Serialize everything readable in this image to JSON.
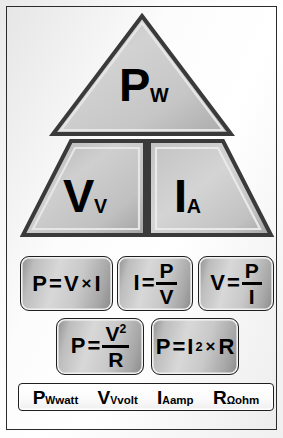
{
  "poster": {
    "title": "Ohm's Law / Power Pyramid Chart",
    "background_color": "#f2f2f2",
    "border_color": "#2b2b2b",
    "fill_color": "#c4c4c4"
  },
  "pyramid": {
    "top": {
      "symbol": "P",
      "subscript": "W",
      "shape": "triangle"
    },
    "left": {
      "symbol": "V",
      "subscript": "V",
      "shape": "trapezoid-left"
    },
    "right": {
      "symbol": "I",
      "subscript": "A",
      "shape": "trapezoid-right"
    }
  },
  "formulas": {
    "row1": [
      {
        "id": "power",
        "lhs": "P",
        "op": "=",
        "a": "V",
        "times": "×",
        "b": "I",
        "layout": "product"
      },
      {
        "id": "current",
        "lhs": "I",
        "op": "=",
        "num": "P",
        "den": "V",
        "layout": "fraction"
      },
      {
        "id": "voltage",
        "lhs": "V",
        "op": "=",
        "num": "P",
        "den": "I",
        "layout": "fraction"
      }
    ],
    "row2": [
      {
        "id": "power-v-squared",
        "lhs": "P",
        "op": "=",
        "num": "V",
        "num_sup": "2",
        "den": "R",
        "layout": "fraction-sup"
      },
      {
        "id": "power-i-squared",
        "lhs": "P",
        "op": "=",
        "a": "I",
        "a_sup": "2",
        "times": "×",
        "b": "R",
        "layout": "product-sup"
      }
    ]
  },
  "legend": [
    {
      "symbol": "P",
      "subscript": "W",
      "unit": "watt"
    },
    {
      "symbol": "V",
      "subscript": "V",
      "unit": "volt"
    },
    {
      "symbol": "I",
      "subscript": "A",
      "unit": "amp"
    },
    {
      "symbol": "R",
      "subscript": "Ω",
      "unit": "ohm"
    }
  ]
}
